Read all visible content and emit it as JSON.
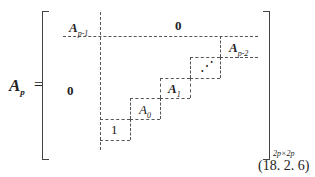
{
  "equation": {
    "lhs_symbol": "A",
    "lhs_subscript": "p",
    "equals": "=",
    "blocks": {
      "top_left": {
        "symbol": "A",
        "subscript": "p-1"
      },
      "top_right": "0",
      "bottom_left": "0",
      "diagonal": [
        {
          "symbol": "A",
          "subscript": "p-2"
        },
        {
          "symbol": "⋰",
          "subscript": ""
        },
        {
          "symbol": "A",
          "subscript": "1"
        },
        {
          "symbol": "A",
          "subscript": "0"
        },
        {
          "symbol": "1",
          "subscript": ""
        }
      ]
    },
    "size_label": "2p×2p",
    "number": "(18. 2. 6)"
  }
}
